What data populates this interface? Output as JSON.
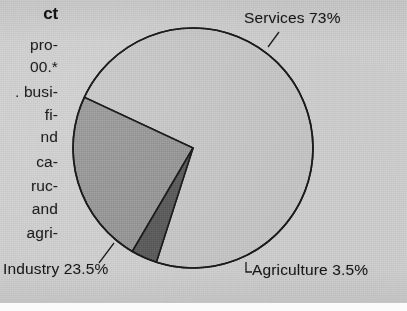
{
  "page": {
    "background_color": "#c9c9c9",
    "kind": "scanned-textbook-page-fragment"
  },
  "left_column": {
    "heading_fragment": "ct",
    "lines": [
      "pro-",
      "00.*",
      ". busi-",
      "fi-",
      "nd",
      "ca-",
      "ruc-",
      "and",
      "agri-"
    ]
  },
  "labels": {
    "services": "Services 73%",
    "industry": "Industry 23.5%",
    "agriculture": "Agriculture 3.5%"
  },
  "chart_data": {
    "type": "pie",
    "title": "",
    "subtitle": "",
    "xlabel": "",
    "ylabel": "",
    "legend_position": "none",
    "labels_inline": true,
    "categories": [
      "Services",
      "Industry",
      "Agriculture"
    ],
    "values": [
      73,
      23.5,
      3.5
    ],
    "units": "percent",
    "total": 100,
    "slices": [
      {
        "name": "Services",
        "value": 73,
        "value_label": "73%",
        "label": "Services 73%",
        "color": "#c0c0c0",
        "start_angle_deg": 205,
        "end_angle_deg": 467.8,
        "sweep_deg": 262.8,
        "leader_line": true
      },
      {
        "name": "Industry",
        "value": 23.5,
        "value_label": "23.5%",
        "label": "Industry 23.5%",
        "color": "#8d8d8d",
        "start_angle_deg": 120.4,
        "end_angle_deg": 205,
        "sweep_deg": 84.6,
        "leader_line": true
      },
      {
        "name": "Agriculture",
        "value": 3.5,
        "value_label": "3.5%",
        "label": "Agriculture 3.5%",
        "color": "#565656",
        "start_angle_deg": 107.8,
        "end_angle_deg": 120.4,
        "sweep_deg": 12.6,
        "leader_line": true
      }
    ],
    "geometry": {
      "center_x": 193,
      "center_y": 148,
      "radius": 120,
      "outline_color": "#1a1a1a",
      "outline_width": 1.6
    }
  }
}
